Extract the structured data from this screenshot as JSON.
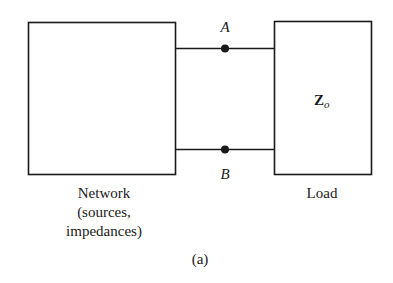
{
  "diagram": {
    "caption": "(a)",
    "network_box": {
      "label_lines": [
        "Network",
        "(sources,",
        "impedances)"
      ]
    },
    "load_box": {
      "label": "Load",
      "impedance_symbol": "Z",
      "impedance_subscript": "o"
    },
    "terminals": {
      "top": "A",
      "bottom": "B"
    },
    "colors": {
      "stroke": "#1a1a1a",
      "background": "#ffffff"
    }
  }
}
